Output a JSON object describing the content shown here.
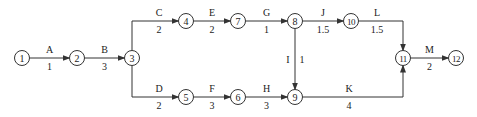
{
  "diagram": {
    "type": "activity-on-arrow network",
    "nodes": [
      {
        "id": "1",
        "label": "1",
        "x": 22,
        "y": 58
      },
      {
        "id": "2",
        "label": "2",
        "x": 77,
        "y": 58
      },
      {
        "id": "3",
        "label": "3",
        "x": 132,
        "y": 58
      },
      {
        "id": "4",
        "label": "4",
        "x": 186,
        "y": 21
      },
      {
        "id": "7",
        "label": "7",
        "x": 238,
        "y": 21
      },
      {
        "id": "8",
        "label": "8",
        "x": 295,
        "y": 21
      },
      {
        "id": "10",
        "label": "10",
        "x": 351,
        "y": 21
      },
      {
        "id": "5",
        "label": "5",
        "x": 186,
        "y": 97
      },
      {
        "id": "6",
        "label": "6",
        "x": 238,
        "y": 97
      },
      {
        "id": "9",
        "label": "9",
        "x": 295,
        "y": 97
      },
      {
        "id": "11",
        "label": "11",
        "x": 403,
        "y": 58
      },
      {
        "id": "12",
        "label": "12",
        "x": 456,
        "y": 58
      }
    ],
    "edges": [
      {
        "activity": "A",
        "duration": "1",
        "from": "1",
        "to": "2"
      },
      {
        "activity": "B",
        "duration": "3",
        "from": "2",
        "to": "3"
      },
      {
        "activity": "C",
        "duration": "2",
        "from": "3",
        "to": "4"
      },
      {
        "activity": "D",
        "duration": "2",
        "from": "3",
        "to": "5"
      },
      {
        "activity": "E",
        "duration": "2",
        "from": "4",
        "to": "7"
      },
      {
        "activity": "F",
        "duration": "3",
        "from": "5",
        "to": "6"
      },
      {
        "activity": "G",
        "duration": "1",
        "from": "7",
        "to": "8"
      },
      {
        "activity": "H",
        "duration": "3",
        "from": "6",
        "to": "9"
      },
      {
        "activity": "I",
        "duration": "1",
        "from": "8",
        "to": "9"
      },
      {
        "activity": "J",
        "duration": "1.5",
        "from": "8",
        "to": "10"
      },
      {
        "activity": "K",
        "duration": "4",
        "from": "9",
        "to": "11"
      },
      {
        "activity": "L",
        "duration": "1.5",
        "from": "10",
        "to": "11"
      },
      {
        "activity": "M",
        "duration": "2",
        "from": "11",
        "to": "12"
      }
    ]
  }
}
